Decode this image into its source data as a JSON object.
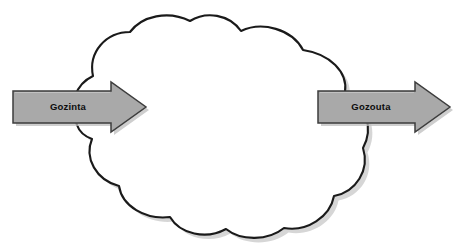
{
  "diagram": {
    "background_color": "#ffffff",
    "cloud": {
      "name": "process-cloud",
      "fill_color": "#ffffff",
      "stroke_color": "#1a1a1a",
      "shadow_color": "#c9c9c9"
    },
    "arrows": [
      {
        "id": "gozinta",
        "label": "Gozinta",
        "direction": "right",
        "role": "input",
        "fill_color": "#a9a9a9",
        "stroke_color": "#3d3d3d",
        "label_color": "#0d0d0d"
      },
      {
        "id": "gozouta",
        "label": "Gozouta",
        "direction": "right",
        "role": "output",
        "fill_color": "#a9a9a9",
        "stroke_color": "#3d3d3d",
        "label_color": "#0d0d0d"
      }
    ]
  }
}
